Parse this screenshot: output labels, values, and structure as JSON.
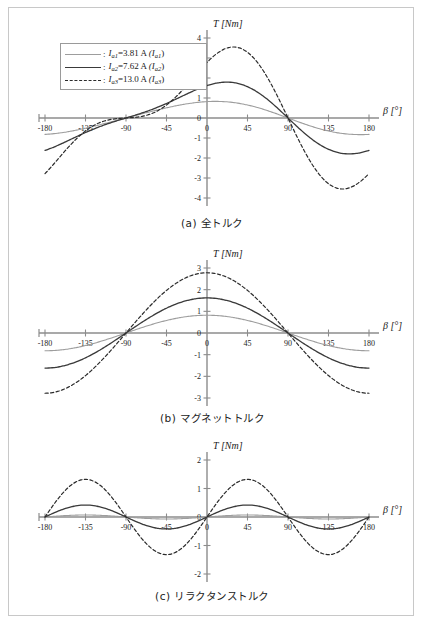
{
  "figure": {
    "axis_label_y": "T [Nm]",
    "axis_label_x": "β [°]"
  },
  "legend": {
    "items": [
      {
        "style": "solid-light",
        "colon": ":",
        "symbol": "I",
        "symbol_sub": "a1",
        "value": "=3.81 A",
        "paren": "(I",
        "paren_sub": "a1",
        "paren_end": ")"
      },
      {
        "style": "solid-dark",
        "colon": ":",
        "symbol": "I",
        "symbol_sub": "a2",
        "value": "=7.62 A",
        "paren": "(I",
        "paren_sub": "a2",
        "paren_end": ")"
      },
      {
        "style": "dashed",
        "colon": ":",
        "symbol": "I",
        "symbol_sub": "a3",
        "value": "=13.0 A",
        "paren": "(I",
        "paren_sub": "a3",
        "paren_end": ")"
      }
    ]
  },
  "captions": {
    "a": "(a) 全トルク",
    "b": "(b) マグネットトルク",
    "c": "(c) リラクタンストルク"
  },
  "colors": {
    "series_light": "#9d9d9d",
    "series_dark": "#3a3a3a",
    "series_dashed": "#2b2b2b",
    "axis": "#8c8c8c",
    "frame": "#c8c8c8",
    "text": "#1a1a1a"
  },
  "chart_data": [
    {
      "type": "line",
      "title": "(a) 全トルク",
      "xlabel": "β [°]",
      "ylabel": "T [Nm]",
      "xlim": [
        -180,
        180
      ],
      "ylim": [
        -4,
        4
      ],
      "xticks": [
        -180,
        -135,
        -90,
        -45,
        0,
        45,
        90,
        135,
        180
      ],
      "yticks": [
        -4,
        -3,
        -2,
        -1,
        0,
        1,
        2,
        3,
        4
      ],
      "grid": false,
      "legend_position": "upper-left",
      "note": "Total torque = magnet torque + reluctance torque",
      "series": [
        {
          "name": "Ia1=3.81 A",
          "style": "solid-light",
          "magnet_amplitude": 0.82,
          "reluctance_amplitude": 0.07,
          "x": [
            -180,
            -165,
            -150,
            -135,
            -120,
            -105,
            -90,
            -75,
            -60,
            -45,
            -30,
            -15,
            0,
            15,
            30,
            45,
            60,
            75,
            90,
            105,
            120,
            135,
            150,
            165,
            180
          ],
          "y": [
            -0.82,
            -0.86,
            -0.78,
            -0.65,
            -0.47,
            -0.25,
            0.0,
            0.25,
            0.47,
            0.65,
            0.78,
            0.86,
            0.82,
            0.86,
            0.78,
            0.65,
            0.47,
            0.25,
            0.0,
            -0.25,
            -0.47,
            -0.65,
            -0.78,
            -0.86,
            -0.82
          ]
        },
        {
          "name": "Ia2=7.62 A",
          "style": "solid-dark",
          "magnet_amplitude": 1.62,
          "reluctance_amplitude": 0.42,
          "x": [
            -180,
            -165,
            -150,
            -135,
            -120,
            -105,
            -90,
            -75,
            -60,
            -45,
            -30,
            -15,
            0,
            15,
            30,
            45,
            60,
            75,
            90,
            105,
            120,
            135,
            150,
            165,
            180
          ],
          "y": [
            -1.62,
            -1.78,
            -1.77,
            -1.56,
            -1.17,
            -0.63,
            0.0,
            0.63,
            1.17,
            1.56,
            1.77,
            1.78,
            1.62,
            1.78,
            1.77,
            1.56,
            1.17,
            0.63,
            0.0,
            -0.63,
            -1.17,
            -1.56,
            -1.77,
            -1.78,
            -1.62
          ]
        },
        {
          "name": "Ia3=13.0 A",
          "style": "dashed",
          "magnet_amplitude": 2.78,
          "reluctance_amplitude": 1.32,
          "x": [
            -180,
            -165,
            -150,
            -135,
            -120,
            -105,
            -90,
            -75,
            -60,
            -45,
            -30,
            -15,
            0,
            15,
            30,
            45,
            60,
            75,
            90,
            105,
            120,
            135,
            150,
            165,
            180
          ],
          "y": [
            -2.78,
            -3.34,
            -3.55,
            -3.29,
            -2.53,
            -1.38,
            0.0,
            1.38,
            2.53,
            3.29,
            3.55,
            3.34,
            2.78,
            3.34,
            3.55,
            3.29,
            2.53,
            1.38,
            0.0,
            -1.38,
            -2.53,
            -3.29,
            -3.55,
            -3.34,
            -2.78
          ]
        }
      ]
    },
    {
      "type": "line",
      "title": "(b) マグネットトルク",
      "xlabel": "β [°]",
      "ylabel": "T [Nm]",
      "xlim": [
        -180,
        180
      ],
      "ylim": [
        -3,
        3
      ],
      "xticks": [
        -180,
        -135,
        -90,
        -45,
        0,
        45,
        90,
        135,
        180
      ],
      "yticks": [
        -3,
        -2,
        -1,
        0,
        1,
        2,
        3
      ],
      "grid": false,
      "note": "Magnet torque proportional to cos(β)",
      "series": [
        {
          "name": "Ia1=3.81 A",
          "style": "solid-light",
          "amplitude": 0.82,
          "x": [
            -180,
            -135,
            -90,
            -45,
            0,
            45,
            90,
            135,
            180
          ],
          "y": [
            -0.82,
            -0.58,
            0.0,
            0.58,
            0.82,
            0.58,
            0.0,
            -0.58,
            -0.82
          ]
        },
        {
          "name": "Ia2=7.62 A",
          "style": "solid-dark",
          "amplitude": 1.62,
          "x": [
            -180,
            -135,
            -90,
            -45,
            0,
            45,
            90,
            135,
            180
          ],
          "y": [
            -1.62,
            -1.15,
            0.0,
            1.15,
            1.62,
            1.15,
            0.0,
            -1.15,
            -1.62
          ]
        },
        {
          "name": "Ia3=13.0 A",
          "style": "dashed",
          "amplitude": 2.78,
          "x": [
            -180,
            -135,
            -90,
            -45,
            0,
            45,
            90,
            135,
            180
          ],
          "y": [
            -2.78,
            -1.97,
            0.0,
            1.97,
            2.78,
            1.97,
            0.0,
            -1.97,
            -2.78
          ]
        }
      ]
    },
    {
      "type": "line",
      "title": "(c) リラクタンストルク",
      "xlabel": "β [°]",
      "ylabel": "T [Nm]",
      "xlim": [
        -180,
        180
      ],
      "ylim": [
        -2,
        2
      ],
      "xticks": [
        -180,
        -135,
        -90,
        -45,
        0,
        45,
        90,
        135,
        180
      ],
      "yticks": [
        -2,
        -1,
        0,
        1,
        2
      ],
      "grid": false,
      "note": "Reluctance torque proportional to sin(2β)",
      "series": [
        {
          "name": "Ia1=3.81 A",
          "style": "solid-light",
          "amplitude": 0.07,
          "x": [
            -180,
            -135,
            -90,
            -45,
            0,
            45,
            90,
            135,
            180
          ],
          "y": [
            0.0,
            0.07,
            0.0,
            -0.07,
            0.0,
            0.07,
            0.0,
            -0.07,
            0.0
          ]
        },
        {
          "name": "Ia2=7.62 A",
          "style": "solid-dark",
          "amplitude": 0.42,
          "x": [
            -180,
            -135,
            -90,
            -45,
            0,
            45,
            90,
            135,
            180
          ],
          "y": [
            0.0,
            0.42,
            0.0,
            -0.42,
            0.0,
            0.42,
            0.0,
            -0.42,
            0.0
          ]
        },
        {
          "name": "Ia3=13.0 A",
          "style": "dashed",
          "amplitude": 1.32,
          "x": [
            -180,
            -135,
            -90,
            -45,
            0,
            45,
            90,
            135,
            180
          ],
          "y": [
            0.0,
            1.32,
            0.0,
            -1.32,
            0.0,
            1.32,
            0.0,
            -1.32,
            0.0
          ]
        }
      ]
    }
  ]
}
